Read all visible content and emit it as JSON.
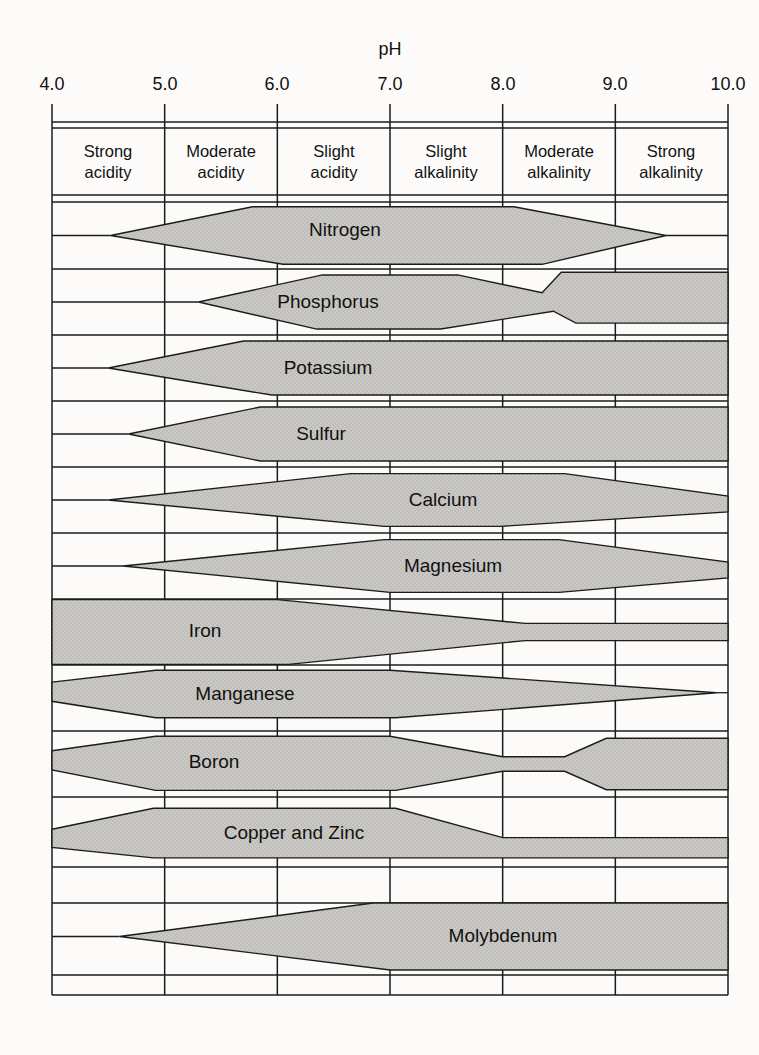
{
  "colors": {
    "paper": "#fcfbf9",
    "line": "#1c1c1c",
    "band_fill": "#cbc9c6",
    "band_dot": "#adaba8",
    "text": "#111111"
  },
  "header": {
    "categories": [
      {
        "line1": "Strong",
        "line2": "acidity"
      },
      {
        "line1": "Moderate",
        "line2": "acidity"
      },
      {
        "line1": "Slight",
        "line2": "acidity"
      },
      {
        "line1": "Slight",
        "line2": "alkalinity"
      },
      {
        "line1": "Moderate",
        "line2": "alkalinity"
      },
      {
        "line1": "Strong",
        "line2": "alkalinity"
      }
    ]
  },
  "chart_data": {
    "type": "area",
    "x_axis": {
      "label": "pH",
      "min": 4.0,
      "max": 10.0,
      "ticks": [
        4.0,
        5.0,
        6.0,
        7.0,
        8.0,
        9.0,
        10.0
      ],
      "tick_labels": [
        "4.0",
        "5.0",
        "6.0",
        "7.0",
        "8.0",
        "9.0",
        "10.0"
      ]
    },
    "zones": [
      "Strong acidity",
      "Moderate acidity",
      "Slight acidity",
      "Slight alkalinity",
      "Moderate alkalinity",
      "Strong alkalinity"
    ],
    "layout": {
      "x0": 52,
      "x1": 728,
      "tick_top": 104,
      "grid_top": 122,
      "grid_bottom": 995,
      "v_gridlines_ph": [
        4.0,
        5.0,
        6.0,
        7.0,
        8.0,
        9.0,
        10.0
      ],
      "h_lines": [
        122,
        128,
        195,
        202,
        269,
        335,
        401,
        467,
        533,
        599,
        665,
        731,
        797,
        867,
        903,
        975,
        995
      ]
    },
    "bands": [
      {
        "label": "Nitrogen",
        "ph_range": [
          4.5,
          9.5
        ],
        "full_range": [
          5.8,
          8.1
        ],
        "row_y": [
          202,
          269
        ],
        "points": [
          [
            4.52,
            0.5
          ],
          [
            5.78,
            0.07
          ],
          [
            8.1,
            0.07
          ],
          [
            9.45,
            0.5
          ],
          [
            8.35,
            0.93
          ],
          [
            6.05,
            0.93
          ]
        ],
        "line_left": {
          "ph": 4.52,
          "frac": 0.5
        },
        "line_right": {
          "ph": 9.45,
          "frac": 0.5
        }
      },
      {
        "label": "Phosphorus",
        "ph_range": [
          5.3,
          10.0
        ],
        "full_range": [
          6.4,
          7.6
        ],
        "row_y": [
          269,
          335
        ],
        "points": [
          [
            5.3,
            0.5
          ],
          [
            6.4,
            0.09
          ],
          [
            7.6,
            0.09
          ],
          [
            8.35,
            0.36
          ],
          [
            8.52,
            0.05
          ],
          [
            10,
            0.05
          ],
          [
            10,
            0.82
          ],
          [
            8.65,
            0.82
          ],
          [
            8.45,
            0.64
          ],
          [
            7.45,
            0.91
          ],
          [
            6.35,
            0.91
          ]
        ],
        "line_left": {
          "ph": 5.3,
          "frac": 0.5
        },
        "line_right": null
      },
      {
        "label": "Potassium",
        "ph_range": [
          4.5,
          10.0
        ],
        "full_range": [
          6.0,
          10.0
        ],
        "row_y": [
          335,
          401
        ],
        "points": [
          [
            4.5,
            0.5
          ],
          [
            5.7,
            0.09
          ],
          [
            10,
            0.09
          ],
          [
            10,
            0.91
          ],
          [
            5.95,
            0.91
          ]
        ],
        "line_left": {
          "ph": 4.5,
          "frac": 0.5
        },
        "line_right": null
      },
      {
        "label": "Sulfur",
        "ph_range": [
          4.7,
          10.0
        ],
        "full_range": [
          5.9,
          10.0
        ],
        "row_y": [
          401,
          467
        ],
        "points": [
          [
            4.68,
            0.5
          ],
          [
            5.85,
            0.09
          ],
          [
            10,
            0.09
          ],
          [
            10,
            0.91
          ],
          [
            5.85,
            0.91
          ]
        ],
        "line_left": {
          "ph": 4.68,
          "frac": 0.5
        },
        "line_right": null
      },
      {
        "label": "Calcium",
        "ph_range": [
          4.5,
          10.0
        ],
        "full_range": [
          6.7,
          8.5
        ],
        "row_y": [
          467,
          533
        ],
        "points": [
          [
            4.5,
            0.5
          ],
          [
            6.65,
            0.1
          ],
          [
            8.55,
            0.1
          ],
          [
            10,
            0.44
          ],
          [
            10,
            0.68
          ],
          [
            7.98,
            0.9
          ],
          [
            6.95,
            0.9
          ]
        ],
        "line_left": {
          "ph": 4.5,
          "frac": 0.5
        },
        "line_right": null
      },
      {
        "label": "Magnesium",
        "ph_range": [
          4.6,
          10.0
        ],
        "full_range": [
          7.0,
          8.5
        ],
        "row_y": [
          533,
          599
        ],
        "points": [
          [
            4.63,
            0.5
          ],
          [
            6.95,
            0.1
          ],
          [
            8.5,
            0.1
          ],
          [
            10,
            0.44
          ],
          [
            10,
            0.68
          ],
          [
            8.5,
            0.9
          ],
          [
            7.0,
            0.9
          ]
        ],
        "line_left": {
          "ph": 4.63,
          "frac": 0.5
        },
        "line_right": null
      },
      {
        "label": "Iron",
        "ph_range": [
          4.0,
          10.0
        ],
        "full_range": [
          4.0,
          6.0
        ],
        "row_y": [
          599,
          665
        ],
        "points": [
          [
            4.0,
            0.01
          ],
          [
            6.0,
            0.01
          ],
          [
            8.2,
            0.37
          ],
          [
            10,
            0.37
          ],
          [
            10,
            0.63
          ],
          [
            8.2,
            0.63
          ],
          [
            6.1,
            0.99
          ],
          [
            4.0,
            0.99
          ]
        ],
        "line_left": null,
        "line_right": null
      },
      {
        "label": "Manganese",
        "ph_range": [
          4.0,
          9.9
        ],
        "full_range": [
          5.0,
          7.0
        ],
        "row_y": [
          665,
          731
        ],
        "points": [
          [
            4.0,
            0.26
          ],
          [
            4.92,
            0.08
          ],
          [
            7.0,
            0.08
          ],
          [
            9.9,
            0.42
          ],
          [
            7.05,
            0.8
          ],
          [
            4.92,
            0.8
          ],
          [
            4.0,
            0.55
          ]
        ],
        "line_left": null,
        "line_right": {
          "ph": 9.9,
          "frac": 0.42
        }
      },
      {
        "label": "Boron",
        "ph_range": [
          4.0,
          10.0
        ],
        "full_range": [
          5.0,
          7.0
        ],
        "row_y": [
          731,
          797
        ],
        "points": [
          [
            4.0,
            0.3
          ],
          [
            4.92,
            0.08
          ],
          [
            7.0,
            0.08
          ],
          [
            8.0,
            0.39
          ],
          [
            8.55,
            0.39
          ],
          [
            8.92,
            0.11
          ],
          [
            10,
            0.11
          ],
          [
            10,
            0.89
          ],
          [
            8.92,
            0.89
          ],
          [
            8.55,
            0.61
          ],
          [
            8.0,
            0.61
          ],
          [
            7.05,
            0.9
          ],
          [
            4.92,
            0.9
          ],
          [
            4.0,
            0.59
          ]
        ],
        "line_left": null,
        "line_right": null
      },
      {
        "label": "Copper and Zinc",
        "ph_range": [
          4.0,
          10.0
        ],
        "full_range": [
          4.9,
          7.1
        ],
        "row_y": [
          797,
          867
        ],
        "points": [
          [
            4.0,
            0.46
          ],
          [
            4.9,
            0.16
          ],
          [
            7.05,
            0.16
          ],
          [
            8.0,
            0.58
          ],
          [
            10,
            0.58
          ],
          [
            10,
            0.87
          ],
          [
            4.9,
            0.87
          ],
          [
            4.0,
            0.72
          ]
        ],
        "line_left": null,
        "line_right": null
      },
      {
        "label": "Molybdenum",
        "ph_range": [
          4.6,
          10.0
        ],
        "full_range": [
          7.0,
          10.0
        ],
        "row_y": [
          903,
          970
        ],
        "points": [
          [
            4.6,
            0.5
          ],
          [
            6.85,
            0.0
          ],
          [
            10,
            0.0
          ],
          [
            10,
            1.0
          ],
          [
            7.0,
            1.0
          ]
        ],
        "line_left": {
          "ph": 4.6,
          "frac": 0.5
        },
        "line_right": null
      }
    ]
  }
}
